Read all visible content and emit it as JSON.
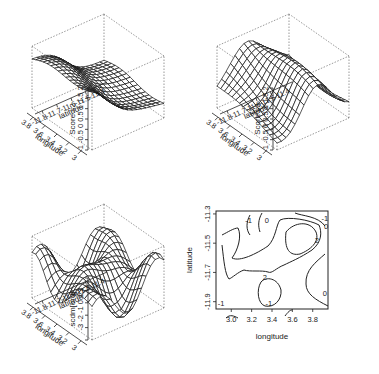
{
  "chart_data": [
    {
      "type": "surface3d",
      "panel": "top-left",
      "zlabel": "Score s2",
      "xlabel": "longitude",
      "ylabel": "latitude",
      "z_ticks": [
        "-1",
        "-0.5",
        "0",
        "0.5",
        "1",
        "1.5",
        "2"
      ],
      "x_ticks": [
        "3",
        "3.2",
        "3.4",
        "3.6",
        "3.8"
      ],
      "y_ticks": [
        "-11.8",
        "-11.7",
        "-11.6",
        "-11.5",
        "-11.4"
      ],
      "zlim": [
        -1,
        2
      ],
      "xlim": [
        2.9,
        3.9
      ],
      "ylim": [
        -11.9,
        -11.3
      ]
    },
    {
      "type": "surface3d",
      "panel": "top-right",
      "zlabel": "Score s3",
      "xlabel": "longitude",
      "ylabel": "latitude",
      "z_ticks": [
        "-1",
        "-0.5",
        "0",
        "0.5",
        "1",
        "1.5",
        "2"
      ],
      "x_ticks": [
        "3",
        "3.2",
        "3.4",
        "3.6",
        "3.8"
      ],
      "y_ticks": [
        "-11.8",
        "-11.7",
        "-11.6",
        "-11.5",
        "-11.4"
      ],
      "zlim": [
        -1,
        2
      ],
      "xlim": [
        2.9,
        3.9
      ],
      "ylim": [
        -11.9,
        -11.3
      ]
    },
    {
      "type": "surface3d",
      "panel": "bottom-left",
      "zlabel": "scdm[ord]",
      "xlabel": "longitude",
      "ylabel": "latitude",
      "z_ticks": [
        "-3",
        "-2",
        "-1",
        "0",
        "1",
        "2"
      ],
      "x_ticks": [
        "3",
        "3.2",
        "3.4",
        "3.6",
        "3.8"
      ],
      "y_ticks": [
        "-11.8",
        "-11.7",
        "-11.6",
        "-11.5",
        "-11.4"
      ],
      "zlim": [
        -3,
        2
      ],
      "xlim": [
        2.9,
        3.9
      ],
      "ylim": [
        -11.9,
        -11.3
      ]
    },
    {
      "type": "contour",
      "panel": "bottom-right",
      "xlabel": "longitude",
      "ylabel": "latitude",
      "x_ticks": [
        "3.0",
        "3.2",
        "3.4",
        "3.6",
        "3.8"
      ],
      "y_ticks": [
        "-11.9",
        "-11.7",
        "-11.5",
        "-11.3"
      ],
      "xlim": [
        2.85,
        3.95
      ],
      "ylim": [
        -11.95,
        -11.28
      ],
      "contour_labels": [
        {
          "text": "-1",
          "x": 3.17,
          "y": -11.34
        },
        {
          "text": "0",
          "x": 3.35,
          "y": -11.34
        },
        {
          "text": "-1",
          "x": 3.92,
          "y": -11.33
        },
        {
          "text": "0",
          "x": 3.93,
          "y": -11.38
        },
        {
          "text": "2",
          "x": 3.84,
          "y": -11.48
        },
        {
          "text": "2",
          "x": 3.33,
          "y": -11.73
        },
        {
          "text": "0",
          "x": 3.92,
          "y": -11.84
        },
        {
          "text": "-1",
          "x": 2.9,
          "y": -11.91
        },
        {
          "text": "-1",
          "x": 3.37,
          "y": -11.91
        }
      ],
      "grid": false
    }
  ]
}
